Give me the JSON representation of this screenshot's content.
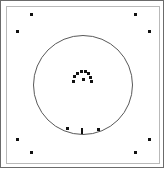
{
  "figure": {
    "title": "",
    "background_color": "#ffffff",
    "outer_frame_color": "#6b6b6b",
    "inner_frame_color": "#b9b9b9",
    "point_color": "#111111",
    "circle_color": "#595959",
    "width": 166,
    "height": 170
  },
  "chart_data": {
    "type": "scatter",
    "title": "",
    "xlabel": "",
    "ylabel": "",
    "xlim": [
      0,
      166
    ],
    "ylim": [
      0,
      170
    ],
    "grid": false,
    "legend": null,
    "annotations": [],
    "shapes": [
      {
        "name": "main-circle",
        "type": "circle",
        "cx": 83,
        "cy": 85,
        "r": 50,
        "stroke": "#595959",
        "fill": "none",
        "stroke_width": 1
      },
      {
        "name": "outer-frame",
        "type": "rect",
        "x": 0,
        "y": 0,
        "width": 164,
        "height": 168,
        "stroke": "#6b6b6b",
        "fill": "none"
      },
      {
        "name": "inner-frame",
        "type": "rect",
        "x": 6,
        "y": 6,
        "width": 154,
        "height": 158,
        "stroke": "#b9b9b9",
        "fill": "none"
      }
    ],
    "series": [
      {
        "name": "corner-points",
        "marker": "square",
        "color": "#111111",
        "size": 3,
        "points": [
          {
            "label": "top-left-inner",
            "x": 31,
            "y": 14
          },
          {
            "label": "top-left-outer",
            "x": 17,
            "y": 31
          },
          {
            "label": "top-right-inner",
            "x": 135,
            "y": 14
          },
          {
            "label": "top-right-outer",
            "x": 149,
            "y": 31
          },
          {
            "label": "bottom-left-outer",
            "x": 17,
            "y": 139
          },
          {
            "label": "bottom-left-inner",
            "x": 31,
            "y": 152
          },
          {
            "label": "bottom-right-outer",
            "x": 149,
            "y": 139
          },
          {
            "label": "bottom-right-inner",
            "x": 135,
            "y": 152
          }
        ]
      },
      {
        "name": "central-arc-cluster",
        "marker": "square",
        "color": "#111111",
        "size": 3,
        "points": [
          {
            "label": "arc-1",
            "x": 73,
            "y": 81
          },
          {
            "label": "arc-2",
            "x": 74,
            "y": 76
          },
          {
            "label": "arc-3",
            "x": 77,
            "y": 73
          },
          {
            "label": "arc-4",
            "x": 81,
            "y": 71
          },
          {
            "label": "arc-5",
            "x": 85,
            "y": 71
          },
          {
            "label": "arc-6",
            "x": 88,
            "y": 73
          },
          {
            "label": "arc-7",
            "x": 90,
            "y": 77
          },
          {
            "label": "arc-8",
            "x": 91,
            "y": 81
          },
          {
            "label": "arc-9",
            "x": 83,
            "y": 79
          }
        ]
      },
      {
        "name": "lower-rim-points",
        "marker": "square",
        "color": "#111111",
        "size": 3,
        "points": [
          {
            "label": "rim-left",
            "x": 67,
            "y": 128
          },
          {
            "label": "rim-center-tick",
            "x": 82,
            "y": 131,
            "marker": "tick"
          },
          {
            "label": "rim-right",
            "x": 98,
            "y": 129
          }
        ]
      }
    ]
  }
}
